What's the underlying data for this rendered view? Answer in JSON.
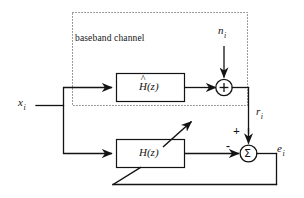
{
  "diagram": {
    "type": "signal-flow-block-diagram",
    "stroke_color": "#131313",
    "dotted_color": "#555555",
    "background": "#ffffff",
    "region_label": "baseband channel",
    "blocks": [
      {
        "id": "channel-estimate",
        "label_base": "H",
        "label_arg": "(z)",
        "accent": "^",
        "has_hat": true
      },
      {
        "id": "adaptive-filter",
        "label_base": "H",
        "label_arg": "(z)",
        "accent": "",
        "has_hat": false,
        "adaptive": true
      }
    ],
    "junctions": [
      {
        "id": "noise-adder",
        "symbol": "+"
      },
      {
        "id": "error-summer",
        "symbol": "Σ",
        "plus_sign": "+",
        "minus_sign": "-"
      }
    ],
    "signals": {
      "input": {
        "name": "x",
        "sub": "i"
      },
      "noise": {
        "name": "n",
        "sub": "i"
      },
      "received": {
        "name": "r",
        "sub": "i"
      },
      "error": {
        "name": "e",
        "sub": "i"
      }
    }
  }
}
